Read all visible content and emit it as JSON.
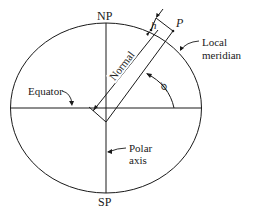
{
  "diagram": {
    "labels": {
      "north_pole": "NP",
      "south_pole": "SP",
      "point": "P",
      "height": "h",
      "local_meridian_line1": "Local",
      "local_meridian_line2": "meridian",
      "equator": "Equator",
      "normal": "Normal",
      "latitude": "ϕ",
      "polar_axis_line1": "Polar",
      "polar_axis_line2": "axis"
    },
    "colors": {
      "line": "#1a1a1a",
      "background": "#ffffff"
    }
  }
}
